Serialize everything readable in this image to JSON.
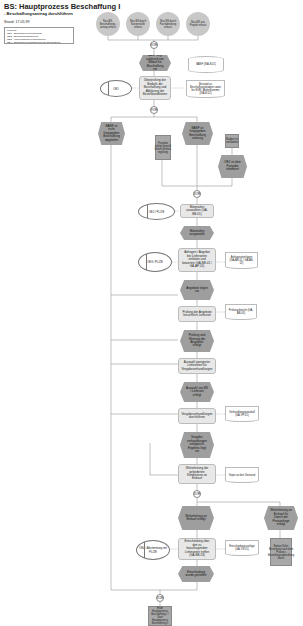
{
  "header": {
    "title": "BS: Hauptprozess Beschaffung I",
    "subtitle": "- Beschaffungsantrag durchführen",
    "stand": "Stand: 17.05.99",
    "legend": {
      "title": "Legende:",
      "items": [
        "OE1 - Bedarfstelle/Projektleitung",
        "OE2 - Beschaffungsabteilung",
        "OE3 - Abteilungsleiter/Projektleitung",
        "OE4 - Bedarfstelle/Fachabteilung der Beschaffung"
      ]
    }
  },
  "start_events": [
    "Neu BS-Beschaffungs-antrag erfasst",
    "Neu BS durch Kostenstelle erfasst",
    "Neu BS durch Fachabteilung erfasst",
    "Neu BS aus Projekt erfasst"
  ],
  "connectors": {
    "xor1": "XOR",
    "xor2": "XOR",
    "xor3": "XOR",
    "xor4": "XOR"
  },
  "flow": {
    "event_bedarf": "BANF liegt aufgrund von Bedarf für Beschaffung vor",
    "func_pruefen": "Überprüfung der Bedarfs der Beschaffung und Abklärung der Bestellkonditionen",
    "org_oe1": "OE1",
    "doc_banf": "BANF (ISA-B.01)",
    "doc_bestand": "Bestand zu Beschaffungsbudget sowie bis EUR / Artikelnummer (ISA-B.02)",
    "event_nicht_freigegeben": "BANF ist nicht freigegeben Beschaffung abgelehnt",
    "event_freigegeben": "BANF ist freigegeben Beschaffung zulässig",
    "note_left": "Freigabe erfolgt gemäß Unterschriften-regelung",
    "note_right": "Budget ist vorhanden",
    "event_budget": "OE2 ist über Freigabe informiert",
    "org_oe2_a": "OE2 / PL/ZE",
    "func_material": "Materialien auswählen (GA-BB-01)",
    "event_material": "Materialien ausgewählt",
    "org_oe3": "OE3 / PL/ZE",
    "func_anfragen": "Anfragen / Angebot bei Lieferanten einholen und bewerten (GA-BB-02 / GA-AP-01)",
    "doc_anfragen": "Anfrageunterlagen (GA-AB-01 / GA-AB-02)",
    "event_angebote": "Angebote liegen vor",
    "func_pruefung": "Prüfung der Angebote hinsichtlich Lieferzeit",
    "doc_pruefung": "Prüfungsbericht (GA-AB-03)",
    "event_pruefung": "Prüfung und Wertung der Angebote erfolgt",
    "func_auswahl": "Auswahl geeigneter Lieferanten für Vergabeverhandlungen",
    "event_auswahl": "Auswahl von BS / Lieferant erfolgt",
    "func_verhandlung": "Vergabeverhandlungen durchführen",
    "doc_verhandlung": "Verhandlungsprotokoll (GA-VP-01)",
    "event_verhandlung": "Vergabe-verhandlungen erfolgreich, Ergebnis liegt vor",
    "func_weiterleitung": "Weiterleitung der geforderten Konditionen an Einkauf",
    "doc_weiterleitung": "Kopie an den Vorstand",
    "event_weiter_erfolgt": "Weiterleitung an Einkauf erfolgt",
    "event_weiter_right": "Weiterleitung an Einkauf für Zweck der Preisanfrage erfolgt",
    "note_right2": "Einkauf führt Bestellung nach dem Prozess Bestellungsabwicklung durch",
    "org_oe4": "OE4 / Abstimmung mit PL/ZE",
    "func_entscheidung": "Entscheidung über den zu beauftragenden Lieferanten treffen (GA-BB-03)",
    "doc_entscheidung": "Entscheidungsvorlage (GA-VS-01)",
    "event_entscheidung": "Entscheidung wurde getroffen",
    "end_note": "Ende Hauptprozess Beschaffung I / Start Hauptprozess Beschaffung II"
  }
}
